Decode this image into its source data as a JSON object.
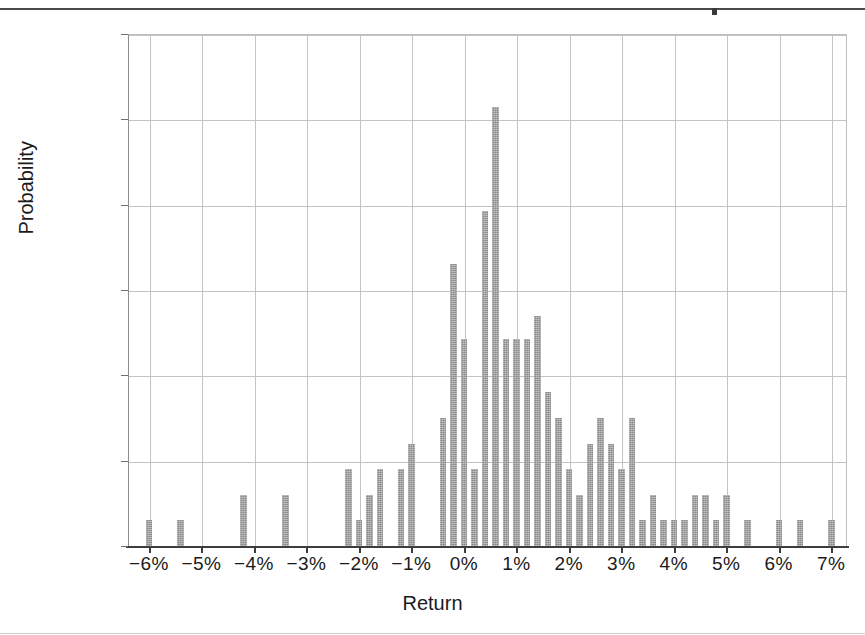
{
  "figure": {
    "top_rule_present": true,
    "background_color": "#ffffff",
    "bar_color": "#8a8a8a",
    "grid_color": "#c4c4c4",
    "axis_color": "#3d3d3d"
  },
  "axes": {
    "y_title": "Probability",
    "x_title": "Return",
    "y_ticks": [
      "0%",
      "2%",
      "4%",
      "6%",
      "8%",
      "10%",
      "12%"
    ],
    "x_ticks": [
      "−6%",
      "−5%",
      "−4%",
      "−3%",
      "−2%",
      "−1%",
      "0%",
      "1%",
      "2%",
      "3%",
      "4%",
      "5%",
      "6%",
      "7%"
    ]
  },
  "chart_data": {
    "type": "bar",
    "title": "",
    "subtitle": "",
    "xlabel": "Return",
    "ylabel": "Probability",
    "xlim": [
      -6.4,
      7.3
    ],
    "ylim": [
      0,
      12
    ],
    "xtick_values": [
      -6,
      -5,
      -4,
      -3,
      -2,
      -1,
      0,
      1,
      2,
      3,
      4,
      5,
      6,
      7
    ],
    "xtick_labels": [
      "−6%",
      "−5%",
      "−4%",
      "−3%",
      "−2%",
      "−1%",
      "0%",
      "1%",
      "2%",
      "3%",
      "4%",
      "5%",
      "6%",
      "7%"
    ],
    "ytick_values": [
      0,
      2,
      4,
      6,
      8,
      10,
      12
    ],
    "ytick_labels": [
      "0%",
      "2%",
      "4%",
      "6%",
      "8%",
      "10%",
      "12%"
    ],
    "grid": "both",
    "legend": "none",
    "bin_width": 0.2,
    "units": "percent",
    "x": [
      -6.0,
      -5.4,
      -4.2,
      -3.4,
      -2.2,
      -2.0,
      -1.8,
      -1.6,
      -1.2,
      -1.0,
      -0.4,
      -0.2,
      0.0,
      0.2,
      0.4,
      0.6,
      0.8,
      1.0,
      1.2,
      1.4,
      1.6,
      1.8,
      2.0,
      2.2,
      2.4,
      2.6,
      2.8,
      3.0,
      3.2,
      3.4,
      3.6,
      3.8,
      4.0,
      4.2,
      4.4,
      4.6,
      4.8,
      5.0,
      5.4,
      6.0,
      6.4,
      7.0
    ],
    "values": [
      0.6,
      0.6,
      1.2,
      1.2,
      1.8,
      0.6,
      1.2,
      1.8,
      1.8,
      2.4,
      3.0,
      6.6,
      4.85,
      1.8,
      7.85,
      10.3,
      4.85,
      4.85,
      4.85,
      5.4,
      3.6,
      3.0,
      1.8,
      1.2,
      2.4,
      3.0,
      2.4,
      1.8,
      3.0,
      0.6,
      1.2,
      0.6,
      0.6,
      0.6,
      1.2,
      1.2,
      0.6,
      1.2,
      0.6,
      0.6,
      0.6,
      0.6
    ],
    "series": [
      {
        "name": "Probability",
        "values": [
          0.6,
          0.6,
          1.2,
          1.2,
          1.8,
          0.6,
          1.2,
          1.8,
          1.8,
          2.4,
          3.0,
          6.6,
          4.85,
          1.8,
          7.85,
          10.3,
          4.85,
          4.85,
          4.85,
          5.4,
          3.6,
          3.0,
          1.8,
          1.2,
          2.4,
          3.0,
          2.4,
          1.8,
          3.0,
          0.6,
          1.2,
          0.6,
          0.6,
          0.6,
          1.2,
          1.2,
          0.6,
          1.2,
          0.6,
          0.6,
          0.6,
          0.6
        ]
      }
    ],
    "peak": {
      "x": 0.6,
      "value": 10.3
    }
  }
}
